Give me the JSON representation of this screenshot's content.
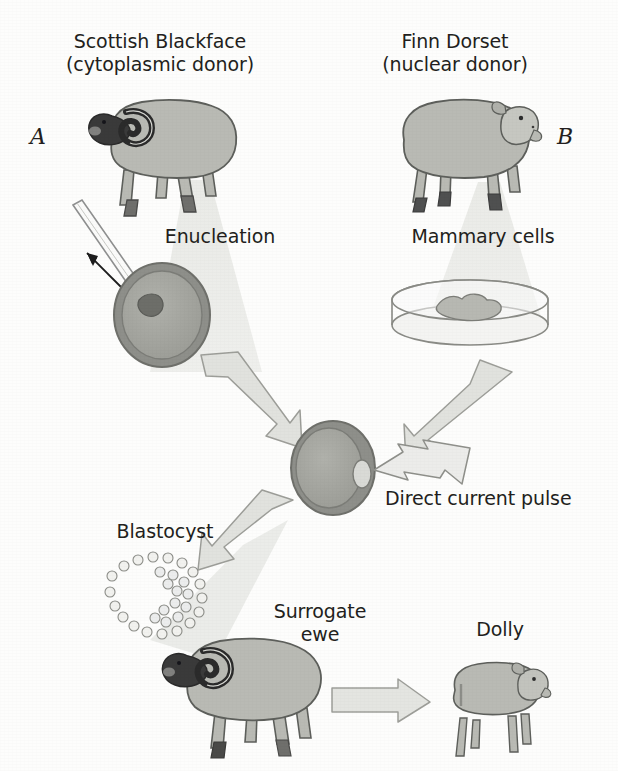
{
  "figure": {
    "panel_a_letter": "A",
    "panel_b_letter": "B",
    "background_color": "#fdfdfc",
    "ink_color": "#231f20"
  },
  "labels": {
    "scottish_blackface": "Scottish Blackface\n(cytoplasmic donor)",
    "finn_dorset": "Finn Dorset\n(nuclear donor)",
    "enucleation": "Enucleation",
    "mammary_cells": "Mammary cells",
    "direct_current_pulse": "Direct current pulse",
    "blastocyst": "Blastocyst",
    "surrogate_ewe": "Surrogate\newe",
    "dolly": "Dolly"
  },
  "palette": {
    "body_fill": "#b9bab4",
    "body_stroke": "#5d5f5b",
    "dark_head": "#3a3a3a",
    "hoof": "#6f6f6c",
    "cell_outer": "#8e8f8a",
    "cell_inner": "#a3a49e",
    "cell_nucleus": "#6d6e69",
    "funnel": "#e4e5e1",
    "arrow_fill": "#e1e2de",
    "arrow_stroke": "#9d9e99",
    "dish_stroke": "#8a8b86",
    "blastomere_fill": "#f2f2ef",
    "blastomere_stroke": "#8b8c87"
  },
  "steps": [
    {
      "id": "step-a-donor",
      "name": "Scottish Blackface cytoplasmic donor",
      "order": 1
    },
    {
      "id": "step-b-donor",
      "name": "Finn Dorset nuclear donor",
      "order": 2
    },
    {
      "id": "step-enucleation",
      "name": "Enucleation of oocyte",
      "order": 3
    },
    {
      "id": "step-mammary-cells",
      "name": "Mammary cells cultured in dish",
      "order": 4
    },
    {
      "id": "step-fusion",
      "name": "Fusion by direct current pulse",
      "order": 5
    },
    {
      "id": "step-blastocyst",
      "name": "Blastocyst development",
      "order": 6
    },
    {
      "id": "step-surrogate",
      "name": "Implantation into surrogate ewe",
      "order": 7
    },
    {
      "id": "step-dolly",
      "name": "Birth of Dolly",
      "order": 8
    }
  ]
}
